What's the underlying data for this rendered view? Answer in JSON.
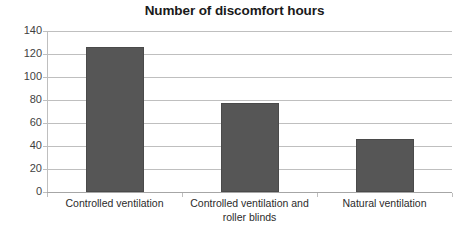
{
  "chart_data": {
    "type": "bar",
    "title": "Number of discomfort hours",
    "xlabel": "",
    "ylabel": "",
    "categories": [
      "Controlled ventilation",
      "Controlled ventilation and roller blinds",
      "Natural ventilation"
    ],
    "values": [
      126,
      77,
      46
    ],
    "ylim": [
      0,
      140
    ],
    "ytick_labels": [
      "0",
      "20",
      "40",
      "60",
      "80",
      "100",
      "120",
      "140"
    ],
    "ytick_values": [
      0,
      20,
      40,
      60,
      80,
      100,
      120,
      140
    ],
    "grid": true,
    "legend": "none",
    "bar_color": "#565656",
    "gridline_color": "#bfbfbf",
    "title_color": "#1a1a1a",
    "label_color": "#2b2b2b"
  }
}
